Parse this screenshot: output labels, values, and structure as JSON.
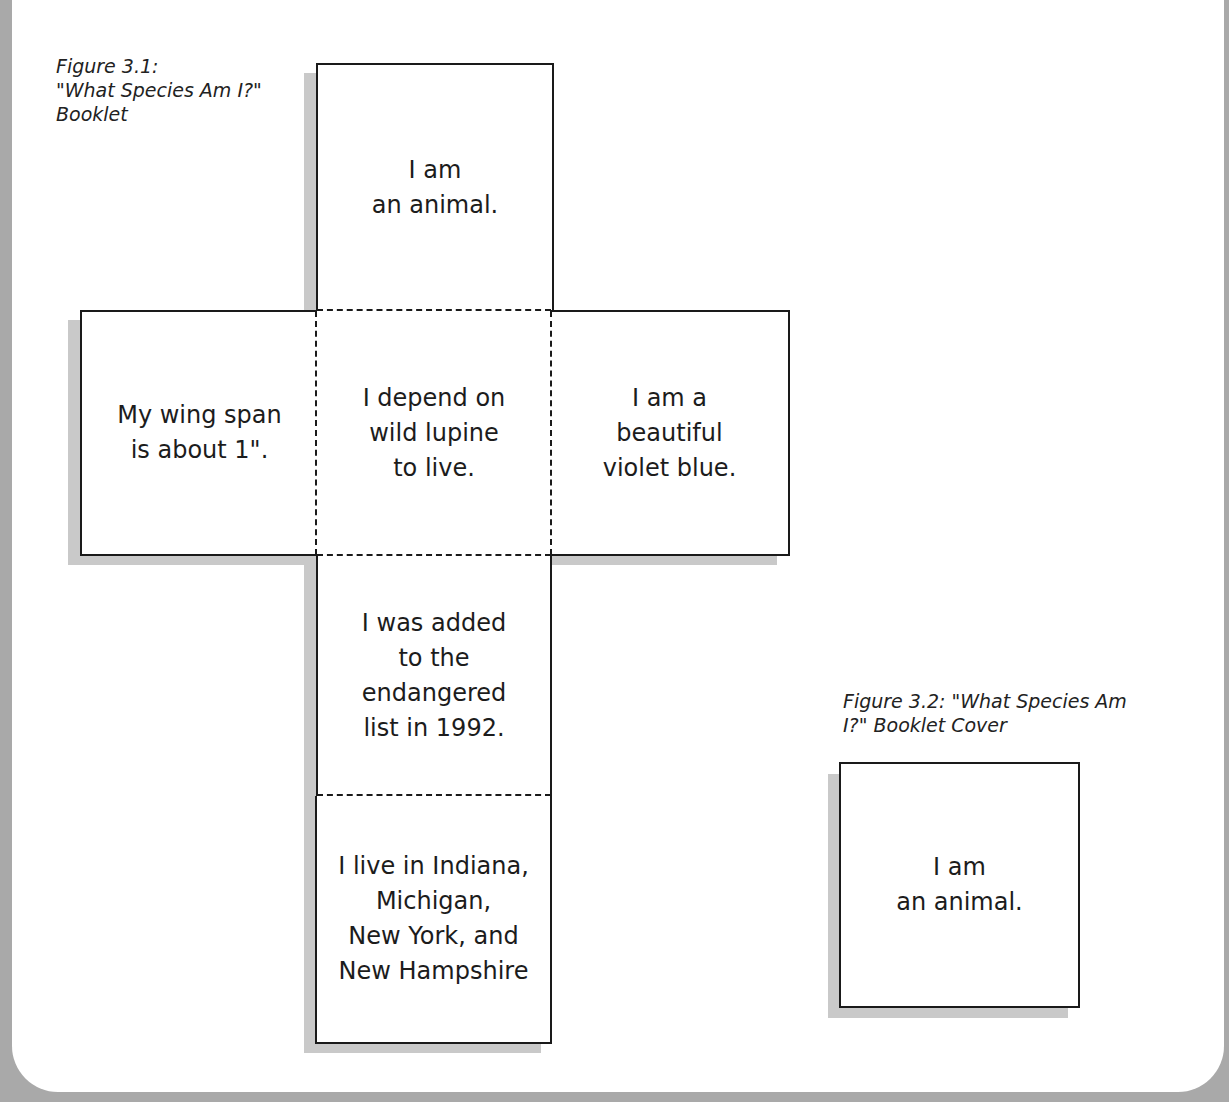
{
  "figure_3_1": {
    "caption_line1": "Figure 3.1:",
    "caption_line2": "\"What Species Am I?\"",
    "caption_line3": "Booklet",
    "panels": {
      "top": "I am\nan animal.",
      "left": "My wing span\nis about 1\".",
      "center": "I depend on\nwild lupine\nto live.",
      "right": "I am a\nbeautiful\nviolet blue.",
      "lower": "I was added\nto the\nendangered\nlist in 1992.",
      "bottom": "I live in Indiana,\nMichigan,\nNew York, and\nNew Hampshire"
    }
  },
  "figure_3_2": {
    "caption_line1": "Figure 3.2: \"What Species Am",
    "caption_line2": "I?\" Booklet Cover",
    "cover_text": "I am\nan animal."
  },
  "colors": {
    "frame": "#a9a9a9",
    "shadow": "#c9c9c9",
    "line": "#1a1a1a"
  }
}
